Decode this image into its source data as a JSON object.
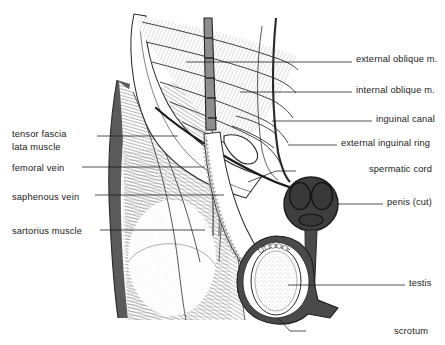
{
  "figure": {
    "background_color": "#ffffff",
    "ink_color": "#1a1a1a",
    "shade_dark": "#4a4a4a",
    "shade_mid": "#8a8a8a",
    "shade_light": "#cfcfcf"
  },
  "labels": {
    "left": [
      {
        "id": "tensor-fascia-lata",
        "line1": "tensor fascia",
        "line2": "lata muscle",
        "x": 12,
        "y": 128,
        "leader": {
          "x1": 97,
          "y1": 136,
          "x2": 178,
          "y2": 136
        }
      },
      {
        "id": "femoral-vein",
        "line1": "femoral vein",
        "line2": "",
        "x": 12,
        "y": 162,
        "leader": {
          "x1": 82,
          "y1": 167,
          "x2": 205,
          "y2": 167
        }
      },
      {
        "id": "saphenous-vein",
        "line1": "saphenous vein",
        "line2": "",
        "x": 12,
        "y": 191,
        "leader": {
          "x1": 95,
          "y1": 195,
          "x2": 224,
          "y2": 195
        }
      },
      {
        "id": "sartorius-muscle",
        "line1": "sartorius muscle",
        "line2": "",
        "x": 12,
        "y": 225,
        "leader": {
          "x1": 100,
          "y1": 230,
          "x2": 205,
          "y2": 230
        }
      }
    ],
    "right": [
      {
        "id": "external-oblique-m",
        "text": "external oblique m.",
        "x": 356,
        "y": 53,
        "leader": {
          "x1": 352,
          "y1": 62,
          "x2": 186,
          "y2": 62
        }
      },
      {
        "id": "internal-oblique-m",
        "text": "internal oblique m.",
        "x": 356,
        "y": 84,
        "leader": {
          "x1": 352,
          "y1": 92,
          "x2": 240,
          "y2": 92
        }
      },
      {
        "id": "inguinal-canal",
        "text": "inguinal canal",
        "x": 376,
        "y": 113,
        "leader": {
          "x1": 372,
          "y1": 121,
          "x2": 272,
          "y2": 121
        }
      },
      {
        "id": "external-inguinal-ring",
        "text": "external inguinal  ring",
        "x": 341,
        "y": 137,
        "leader": {
          "x1": 337,
          "y1": 145,
          "x2": 288,
          "y2": 145
        }
      },
      {
        "id": "spermatic-cord",
        "text": "spermatic cord",
        "x": 369,
        "y": 163,
        "leader": {
          "x1": 365,
          "y1": 171,
          "x2": 296,
          "y2": 171
        }
      },
      {
        "id": "penis-cut",
        "text": "penis (cut)",
        "x": 387,
        "y": 196,
        "leader": {
          "x1": 383,
          "y1": 204,
          "x2": 337,
          "y2": 204
        }
      },
      {
        "id": "testis",
        "text": "testis",
        "x": 409,
        "y": 277,
        "leader": {
          "x1": 405,
          "y1": 285,
          "x2": 288,
          "y2": 285
        }
      },
      {
        "id": "scrotum",
        "text": "scrotum",
        "x": 394,
        "y": 325,
        "leader": {
          "x1": 390,
          "y1": 331,
          "x2": 306,
          "y2": 331
        }
      }
    ]
  },
  "structures": [
    {
      "id": "external-oblique-aponeurosis",
      "name": "external oblique aponeurosis"
    },
    {
      "id": "internal-oblique-muscle",
      "name": "internal oblique muscle"
    },
    {
      "id": "rectus-sheath-band",
      "name": "rectus sheath band"
    },
    {
      "id": "inguinal-ligament",
      "name": "inguinal ligament"
    },
    {
      "id": "inguinal-canal",
      "name": "inguinal canal"
    },
    {
      "id": "external-inguinal-ring",
      "name": "external inguinal ring"
    },
    {
      "id": "spermatic-cord",
      "name": "spermatic cord"
    },
    {
      "id": "penis-cross-section",
      "name": "penis cross-section (cut)"
    },
    {
      "id": "corpus-cavernosum-left",
      "name": "left corpus cavernosum"
    },
    {
      "id": "corpus-cavernosum-right",
      "name": "right corpus cavernosum"
    },
    {
      "id": "corpus-spongiosum",
      "name": "corpus spongiosum"
    },
    {
      "id": "testis",
      "name": "testis"
    },
    {
      "id": "epididymis",
      "name": "epididymis"
    },
    {
      "id": "scrotum-wall",
      "name": "scrotal wall"
    },
    {
      "id": "tensor-fascia-lata",
      "name": "tensor fascia lata muscle"
    },
    {
      "id": "sartorius-muscle",
      "name": "sartorius muscle"
    },
    {
      "id": "femoral-vein",
      "name": "femoral vein"
    },
    {
      "id": "saphenous-vein",
      "name": "saphenous vein"
    },
    {
      "id": "thigh-lateral-edge",
      "name": "lateral thigh margin"
    }
  ]
}
